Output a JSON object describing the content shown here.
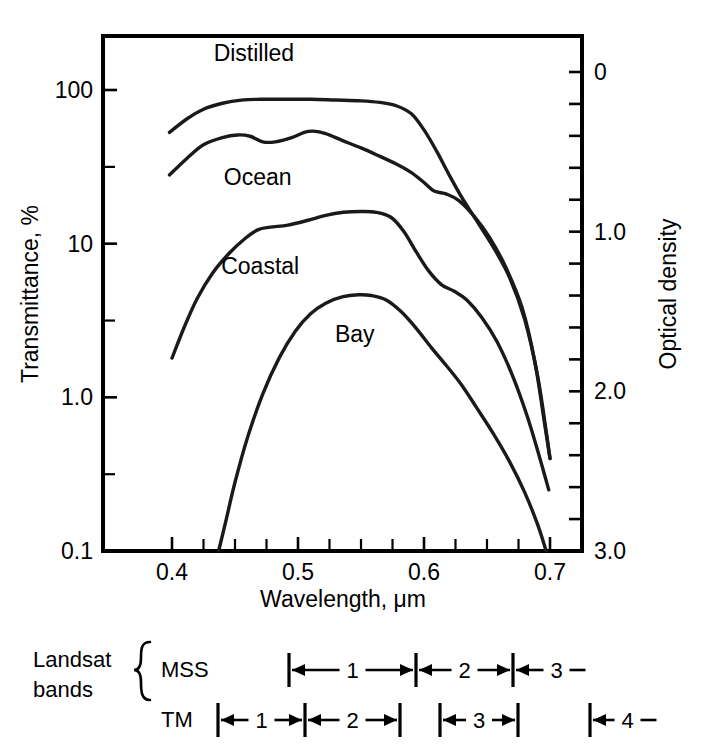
{
  "chart_data": {
    "type": "line",
    "title": "",
    "xlabel": "Wavelength, μm",
    "ylabel": "Transmittance, %",
    "y2label": "Optical density",
    "xlim": [
      0.37,
      0.73
    ],
    "xticks": [
      0.4,
      0.5,
      0.6,
      0.7
    ],
    "xticklabels": [
      "0.4",
      "0.5",
      "0.6",
      "0.7"
    ],
    "xminorticks": [
      0.425,
      0.45,
      0.475,
      0.525,
      0.55,
      0.575,
      0.625,
      0.65,
      0.675
    ],
    "yscale": "log",
    "ylim": [
      0.1,
      200
    ],
    "yticks": [
      100,
      10,
      1.0,
      0.1
    ],
    "yticklabels": [
      "100",
      "10",
      "1.0",
      "0.1"
    ],
    "yminorticks": [
      31.6,
      3.16,
      0.316,
      0.0316
    ],
    "y2lim": [
      0,
      3.0
    ],
    "y2ticks": [
      0,
      1.0,
      2.0,
      3.0
    ],
    "y2ticklabels": [
      "0",
      "1.0",
      "2.0",
      "3.0"
    ],
    "y2minortick_step": 0.2,
    "grid": false,
    "legend": "inline-labels",
    "series": [
      {
        "name": "Distilled",
        "label_x": 0.465,
        "label_y": 175,
        "points": [
          [
            0.398,
            53
          ],
          [
            0.412,
            65
          ],
          [
            0.425,
            75
          ],
          [
            0.44,
            82
          ],
          [
            0.455,
            86
          ],
          [
            0.47,
            87
          ],
          [
            0.49,
            87
          ],
          [
            0.51,
            87
          ],
          [
            0.53,
            86
          ],
          [
            0.55,
            85
          ],
          [
            0.565,
            83
          ],
          [
            0.578,
            79
          ],
          [
            0.59,
            70
          ],
          [
            0.6,
            55
          ],
          [
            0.61,
            40
          ],
          [
            0.62,
            28
          ],
          [
            0.63,
            20
          ],
          [
            0.642,
            14
          ],
          [
            0.655,
            9.5
          ],
          [
            0.668,
            6.0
          ],
          [
            0.68,
            3.2
          ],
          [
            0.69,
            1.4
          ],
          [
            0.697,
            0.6
          ],
          [
            0.7,
            0.4
          ]
        ]
      },
      {
        "name": "Ocean",
        "label_x": 0.468,
        "label_y": 27,
        "points": [
          [
            0.398,
            28
          ],
          [
            0.412,
            36
          ],
          [
            0.425,
            44
          ],
          [
            0.44,
            49
          ],
          [
            0.452,
            51
          ],
          [
            0.462,
            50
          ],
          [
            0.472,
            46
          ],
          [
            0.482,
            46
          ],
          [
            0.495,
            49
          ],
          [
            0.505,
            53
          ],
          [
            0.512,
            54
          ],
          [
            0.522,
            52
          ],
          [
            0.535,
            47
          ],
          [
            0.55,
            42
          ],
          [
            0.565,
            37
          ],
          [
            0.578,
            33
          ],
          [
            0.59,
            29
          ],
          [
            0.6,
            25
          ],
          [
            0.608,
            22
          ],
          [
            0.618,
            21
          ],
          [
            0.628,
            19
          ],
          [
            0.64,
            15
          ],
          [
            0.652,
            11
          ],
          [
            0.665,
            7.0
          ],
          [
            0.678,
            3.8
          ],
          [
            0.688,
            1.7
          ],
          [
            0.696,
            0.65
          ],
          [
            0.7,
            0.4
          ]
        ]
      },
      {
        "name": "Coastal",
        "label_x": 0.47,
        "label_y": 7.2,
        "points": [
          [
            0.4,
            1.8
          ],
          [
            0.41,
            2.9
          ],
          [
            0.42,
            4.4
          ],
          [
            0.432,
            6.4
          ],
          [
            0.445,
            8.6
          ],
          [
            0.458,
            10.8
          ],
          [
            0.468,
            12.3
          ],
          [
            0.478,
            12.8
          ],
          [
            0.492,
            13.2
          ],
          [
            0.508,
            14.2
          ],
          [
            0.522,
            15.3
          ],
          [
            0.536,
            16.0
          ],
          [
            0.55,
            16.2
          ],
          [
            0.562,
            16.0
          ],
          [
            0.574,
            14.8
          ],
          [
            0.584,
            12.0
          ],
          [
            0.594,
            8.8
          ],
          [
            0.604,
            6.6
          ],
          [
            0.614,
            5.4
          ],
          [
            0.624,
            4.9
          ],
          [
            0.634,
            4.3
          ],
          [
            0.646,
            3.3
          ],
          [
            0.658,
            2.3
          ],
          [
            0.67,
            1.4
          ],
          [
            0.682,
            0.75
          ],
          [
            0.692,
            0.4
          ],
          [
            0.699,
            0.25
          ]
        ]
      },
      {
        "name": "Bay",
        "label_x": 0.545,
        "label_y": 2.6,
        "points": [
          [
            0.437,
            0.1
          ],
          [
            0.443,
            0.16
          ],
          [
            0.45,
            0.28
          ],
          [
            0.46,
            0.55
          ],
          [
            0.472,
            1.05
          ],
          [
            0.485,
            1.8
          ],
          [
            0.498,
            2.7
          ],
          [
            0.51,
            3.5
          ],
          [
            0.522,
            4.1
          ],
          [
            0.535,
            4.5
          ],
          [
            0.548,
            4.65
          ],
          [
            0.558,
            4.6
          ],
          [
            0.57,
            4.3
          ],
          [
            0.582,
            3.6
          ],
          [
            0.594,
            2.8
          ],
          [
            0.606,
            2.1
          ],
          [
            0.618,
            1.6
          ],
          [
            0.63,
            1.2
          ],
          [
            0.642,
            0.85
          ],
          [
            0.655,
            0.58
          ],
          [
            0.668,
            0.38
          ],
          [
            0.68,
            0.24
          ],
          [
            0.69,
            0.15
          ],
          [
            0.697,
            0.1
          ]
        ]
      }
    ]
  },
  "axes": {
    "left_title": "Transmittance, %",
    "right_title": "Optical density",
    "bottom_title": "Wavelength, μm"
  },
  "landsat": {
    "group_label_line1": "Landsat",
    "group_label_line2": "bands",
    "rows": [
      {
        "name": "MSS",
        "label": "MSS",
        "bands": [
          {
            "number": "1",
            "x_start": 289,
            "x_end": 416,
            "open_end": false
          },
          {
            "number": "2",
            "x_start": 416,
            "x_end": 513,
            "open_end": false
          },
          {
            "number": "3",
            "x_start": 513,
            "x_end": 600,
            "open_end": true
          }
        ]
      },
      {
        "name": "TM",
        "label": "TM",
        "bands": [
          {
            "number": "1",
            "x_start": 218,
            "x_end": 305,
            "open_end": false
          },
          {
            "number": "2",
            "x_start": 305,
            "x_end": 400,
            "open_end": false
          },
          {
            "number": "3",
            "x_start": 440,
            "x_end": 518,
            "open_end": false
          },
          {
            "number": "4",
            "x_start": 590,
            "x_end": 665,
            "open_end": true
          }
        ]
      }
    ]
  }
}
